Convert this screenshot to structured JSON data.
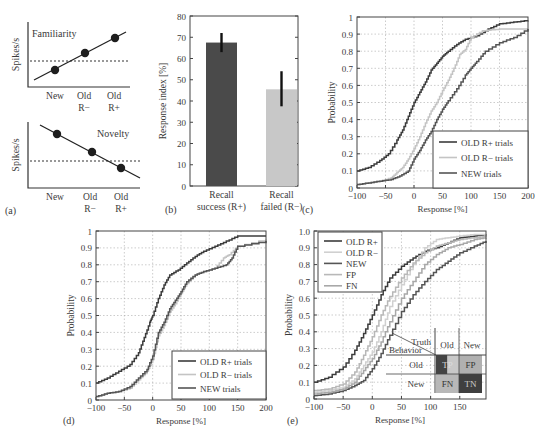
{
  "figure": {
    "panel_labels": [
      "(a)",
      "(b)",
      "(c)",
      "(d)",
      "(e)"
    ]
  },
  "chart_data": [
    {
      "id": "a-top",
      "type": "line",
      "title": "Familiarity",
      "ylabel": "Spikes/s",
      "categories": [
        "New",
        "Old R−",
        "Old R+"
      ],
      "category_lines": [
        [
          "New"
        ],
        [
          "Old",
          "R−"
        ],
        [
          "Old",
          "R+"
        ]
      ],
      "values": [
        1,
        2,
        3
      ],
      "baseline": 1.5,
      "trend": "increasing"
    },
    {
      "id": "a-bottom",
      "type": "line",
      "title": "Novelty",
      "ylabel": "Spikes/s",
      "categories": [
        "New",
        "Old R−",
        "Old R+"
      ],
      "category_lines": [
        [
          "New"
        ],
        [
          "Old",
          "R−"
        ],
        [
          "Old",
          "R+"
        ]
      ],
      "values": [
        3,
        2,
        1
      ],
      "baseline": 1.5,
      "trend": "decreasing"
    },
    {
      "id": "b",
      "type": "bar",
      "ylabel": "Response index [%]",
      "categories": [
        "Recall success (R+)",
        "Recall failed (R−)"
      ],
      "category_lines": [
        [
          "Recall",
          "success (R+)"
        ],
        [
          "Recall",
          "failed (R−)"
        ]
      ],
      "values": [
        67.5,
        45.5
      ],
      "error_low": [
        63,
        37.5
      ],
      "error_high": [
        72,
        54
      ],
      "colors": [
        "#4a4a4a",
        "#c8c8c8"
      ],
      "ylim": [
        0,
        80
      ],
      "yticks": [
        0,
        10,
        20,
        30,
        40,
        50,
        60,
        70,
        80
      ]
    },
    {
      "id": "c",
      "type": "line",
      "xlabel": "Response [%]",
      "ylabel": "Probability",
      "xlim": [
        -100,
        200
      ],
      "ylim": [
        0,
        1
      ],
      "xticks": [
        -100,
        -50,
        0,
        50,
        100,
        150,
        200
      ],
      "yticks": [
        0,
        0.1,
        0.2,
        0.3,
        0.4,
        0.5,
        0.6,
        0.7,
        0.8,
        0.9,
        1
      ],
      "ytick_labels": [
        "0",
        "0.1",
        "0.2",
        "0.3",
        "0.4",
        "0.5",
        "0.6",
        "0.7",
        "0.8",
        "0.9",
        "1"
      ],
      "grid": true,
      "legend_position": "lower right",
      "series": [
        {
          "name": "OLD R+ trials",
          "color": "#3c3c3c",
          "x": [
            -100,
            -80,
            -60,
            -45,
            -30,
            -20,
            -10,
            0,
            10,
            20,
            30,
            40,
            50,
            60,
            75,
            90,
            110,
            130,
            150,
            175,
            200
          ],
          "y": [
            0.1,
            0.12,
            0.16,
            0.2,
            0.28,
            0.34,
            0.42,
            0.5,
            0.56,
            0.62,
            0.69,
            0.73,
            0.77,
            0.8,
            0.84,
            0.87,
            0.89,
            0.93,
            0.96,
            0.97,
            0.98
          ]
        },
        {
          "name": "OLD R− trials",
          "color": "#c4c4c4",
          "x": [
            -100,
            -80,
            -60,
            -40,
            -30,
            -20,
            -10,
            0,
            10,
            20,
            30,
            40,
            50,
            60,
            70,
            80,
            90,
            100,
            120,
            150,
            200
          ],
          "y": [
            0.02,
            0.03,
            0.04,
            0.06,
            0.09,
            0.12,
            0.17,
            0.23,
            0.3,
            0.38,
            0.45,
            0.5,
            0.57,
            0.63,
            0.7,
            0.78,
            0.81,
            0.88,
            0.92,
            0.93,
            0.93
          ]
        },
        {
          "name": "NEW trials",
          "color": "#555555",
          "x": [
            -100,
            -80,
            -60,
            -40,
            -25,
            -10,
            0,
            10,
            20,
            30,
            40,
            50,
            60,
            75,
            90,
            100,
            110,
            125,
            150,
            175,
            200
          ],
          "y": [
            0.02,
            0.03,
            0.04,
            0.05,
            0.07,
            0.1,
            0.17,
            0.22,
            0.28,
            0.33,
            0.4,
            0.46,
            0.51,
            0.58,
            0.66,
            0.7,
            0.74,
            0.8,
            0.85,
            0.88,
            0.93
          ]
        }
      ]
    },
    {
      "id": "d",
      "type": "line",
      "xlabel": "Response [%]",
      "ylabel": "Probability",
      "xlim": [
        -100,
        200
      ],
      "ylim": [
        0,
        1
      ],
      "xticks": [
        -100,
        -50,
        0,
        50,
        100,
        150,
        200
      ],
      "yticks": [
        0,
        0.1,
        0.2,
        0.3,
        0.4,
        0.5,
        0.6,
        0.7,
        0.8,
        0.9,
        1
      ],
      "ytick_labels": [
        "0",
        "0.1",
        "0.2",
        "0.3",
        "0.4",
        "0.5",
        "0.6",
        "0.7",
        "0.8",
        "0.9",
        "1"
      ],
      "grid": true,
      "legend_position": "lower right",
      "series": [
        {
          "name": "OLD R+ trials",
          "color": "#3c3c3c",
          "x": [
            -100,
            -80,
            -60,
            -40,
            -25,
            -15,
            -5,
            0,
            10,
            20,
            30,
            45,
            60,
            75,
            90,
            110,
            130,
            150,
            175,
            200
          ],
          "y": [
            0.1,
            0.13,
            0.17,
            0.21,
            0.28,
            0.37,
            0.46,
            0.5,
            0.6,
            0.68,
            0.74,
            0.77,
            0.81,
            0.85,
            0.88,
            0.91,
            0.94,
            0.97,
            0.97,
            0.97
          ]
        },
        {
          "name": "OLD R− trials",
          "color": "#c4c4c4",
          "x": [
            -100,
            -80,
            -60,
            -40,
            -25,
            -10,
            0,
            10,
            20,
            30,
            40,
            50,
            60,
            75,
            90,
            110,
            125,
            135,
            150,
            200
          ],
          "y": [
            0.02,
            0.04,
            0.05,
            0.07,
            0.12,
            0.17,
            0.24,
            0.38,
            0.44,
            0.52,
            0.57,
            0.63,
            0.69,
            0.74,
            0.76,
            0.78,
            0.84,
            0.86,
            0.91,
            0.95
          ]
        },
        {
          "name": "NEW trials",
          "color": "#555555",
          "x": [
            -100,
            -80,
            -60,
            -40,
            -25,
            -10,
            0,
            10,
            20,
            30,
            40,
            50,
            60,
            75,
            90,
            110,
            130,
            140,
            150,
            200
          ],
          "y": [
            0.02,
            0.04,
            0.05,
            0.08,
            0.13,
            0.18,
            0.26,
            0.4,
            0.46,
            0.54,
            0.59,
            0.64,
            0.7,
            0.74,
            0.76,
            0.78,
            0.8,
            0.84,
            0.91,
            0.94
          ]
        }
      ]
    },
    {
      "id": "e",
      "type": "line",
      "xlabel": "Response [%]",
      "ylabel": "Probability",
      "xlim": [
        -100,
        195
      ],
      "ylim": [
        0,
        1
      ],
      "xticks": [
        -100,
        -50,
        0,
        50,
        100,
        150
      ],
      "yticks": [
        0,
        0.1,
        0.2,
        0.3,
        0.4,
        0.5,
        0.6,
        0.7,
        0.8,
        0.9,
        1.0
      ],
      "ytick_labels": [
        "0",
        "0.1",
        "0.2",
        "0.3",
        "0.4",
        "0.5",
        "0.6",
        "0.7",
        "0.8",
        "0.9",
        "1.0"
      ],
      "grid": true,
      "legend_position": "upper left",
      "series": [
        {
          "name": "OLD R+",
          "color": "#3c3c3c",
          "x": [
            -100,
            -75,
            -50,
            -30,
            -15,
            0,
            15,
            30,
            50,
            70,
            90,
            110,
            130,
            150,
            175,
            195
          ],
          "y": [
            0.1,
            0.13,
            0.19,
            0.29,
            0.39,
            0.5,
            0.62,
            0.72,
            0.79,
            0.84,
            0.88,
            0.9,
            0.93,
            0.96,
            0.97,
            0.98
          ]
        },
        {
          "name": "OLD R−",
          "color": "#d0d0d0",
          "x": [
            -100,
            -75,
            -50,
            -30,
            -15,
            0,
            15,
            30,
            50,
            70,
            90,
            110,
            130,
            150,
            175,
            195
          ],
          "y": [
            0.04,
            0.05,
            0.07,
            0.12,
            0.2,
            0.28,
            0.4,
            0.55,
            0.68,
            0.8,
            0.9,
            0.95,
            0.96,
            0.97,
            0.98,
            0.98
          ]
        },
        {
          "name": "NEW",
          "color": "#555555",
          "x": [
            -100,
            -75,
            -50,
            -30,
            -15,
            0,
            15,
            30,
            50,
            70,
            90,
            110,
            130,
            150,
            175,
            195
          ],
          "y": [
            0.02,
            0.03,
            0.05,
            0.08,
            0.11,
            0.18,
            0.27,
            0.38,
            0.52,
            0.62,
            0.7,
            0.77,
            0.82,
            0.87,
            0.91,
            0.94
          ]
        },
        {
          "name": "FP",
          "color": "#b8b8b8",
          "x": [
            -100,
            -75,
            -50,
            -30,
            -15,
            0,
            15,
            30,
            50,
            70,
            90,
            110,
            130,
            150,
            175,
            195
          ],
          "y": [
            0.05,
            0.06,
            0.09,
            0.16,
            0.26,
            0.37,
            0.5,
            0.61,
            0.72,
            0.81,
            0.87,
            0.91,
            0.93,
            0.95,
            0.96,
            0.97
          ]
        },
        {
          "name": "FN",
          "color": "#a8a8a8",
          "x": [
            -100,
            -75,
            -50,
            -30,
            -15,
            0,
            15,
            30,
            50,
            70,
            90,
            110,
            130,
            150,
            175,
            195
          ],
          "y": [
            0.03,
            0.04,
            0.06,
            0.1,
            0.17,
            0.24,
            0.34,
            0.46,
            0.6,
            0.7,
            0.8,
            0.86,
            0.9,
            0.92,
            0.95,
            0.96
          ]
        }
      ],
      "inset": {
        "type": "confusion_matrix",
        "corner_top": "Truth",
        "corner_left": "Behavior",
        "columns": [
          "Old",
          "New"
        ],
        "rows": [
          "Old",
          "New"
        ],
        "cells": [
          [
            "TP",
            "FP"
          ],
          [
            "FN",
            "TN"
          ]
        ],
        "cell_colors": [
          [
            "#444444",
            "#b0b0b0"
          ],
          [
            "#b8b8b8",
            "#3f3f3f"
          ]
        ],
        "tp_split_color": "#c8c8c8"
      }
    }
  ]
}
